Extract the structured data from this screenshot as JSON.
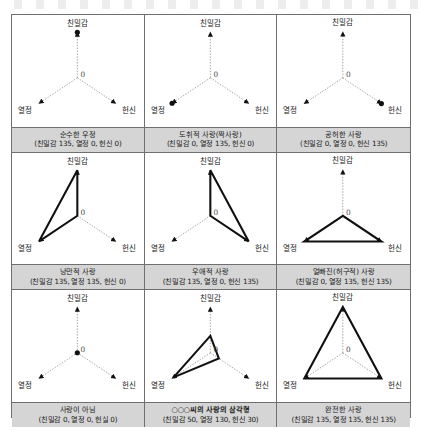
{
  "figure": {
    "axis_labels": {
      "top": "친밀감",
      "bottom_left": "열정",
      "bottom_right": "헌신",
      "origin": "0"
    },
    "max_value": 135,
    "colors": {
      "caption_background": "#d5d5d5",
      "border": "#6f6f6f",
      "axis_line": "#8a8a8a",
      "shape_line": "#111111",
      "marker": "#111111",
      "page_background": "#ffffff"
    }
  },
  "cells": [
    {
      "id": "pure-friendship",
      "title": "순수한 우정",
      "values_text": "(친밀감 135, 열정 0, 헌신 0)",
      "intimacy": 135,
      "passion": 0,
      "commitment": 0,
      "shape": "point",
      "bold_title": false
    },
    {
      "id": "infatuated-love",
      "title": "도취적 사랑(짝사랑)",
      "values_text": "(친밀감 0, 열정 135, 헌신 0)",
      "intimacy": 0,
      "passion": 135,
      "commitment": 0,
      "shape": "point",
      "bold_title": false
    },
    {
      "id": "empty-love",
      "title": "공허한 사랑",
      "values_text": "(친밀감 0, 열정 0, 헌신 135)",
      "intimacy": 0,
      "passion": 0,
      "commitment": 135,
      "shape": "point",
      "bold_title": false
    },
    {
      "id": "romantic-love",
      "title": "낭만적 사랑",
      "values_text": "(친밀감 135, 열정 135, 헌신 0)",
      "intimacy": 135,
      "passion": 135,
      "commitment": 0,
      "shape": "triangle",
      "bold_title": false
    },
    {
      "id": "companionate-love",
      "title": "우애적 사랑",
      "values_text": "(친밀감 135, 열정 0, 헌신 135)",
      "intimacy": 135,
      "passion": 0,
      "commitment": 135,
      "shape": "triangle",
      "bold_title": false
    },
    {
      "id": "fatuous-love",
      "title": "얼빠진(허구적) 사랑",
      "values_text": "(친밀감 0, 열정 135, 헌신 135)",
      "intimacy": 0,
      "passion": 135,
      "commitment": 135,
      "shape": "triangle",
      "bold_title": false
    },
    {
      "id": "nonlove",
      "title": "사랑이 아님",
      "values_text": "(친밀감 0, 열정 0, 헌실 0)",
      "intimacy": 0,
      "passion": 0,
      "commitment": 0,
      "shape": "point",
      "bold_title": false
    },
    {
      "id": "personal-love-triangle",
      "title": "○○○씨의 사랑의 삼각형",
      "values_text": "(친밀감 50, 열정 130, 헌신 30)",
      "intimacy": 50,
      "passion": 130,
      "commitment": 30,
      "shape": "triangle",
      "bold_title": true
    },
    {
      "id": "consummate-love",
      "title": "완전한 사랑",
      "values_text": "(친밀감 135, 열정 135, 헌신 135)",
      "intimacy": 135,
      "passion": 135,
      "commitment": 135,
      "shape": "triangle",
      "bold_title": false
    }
  ]
}
